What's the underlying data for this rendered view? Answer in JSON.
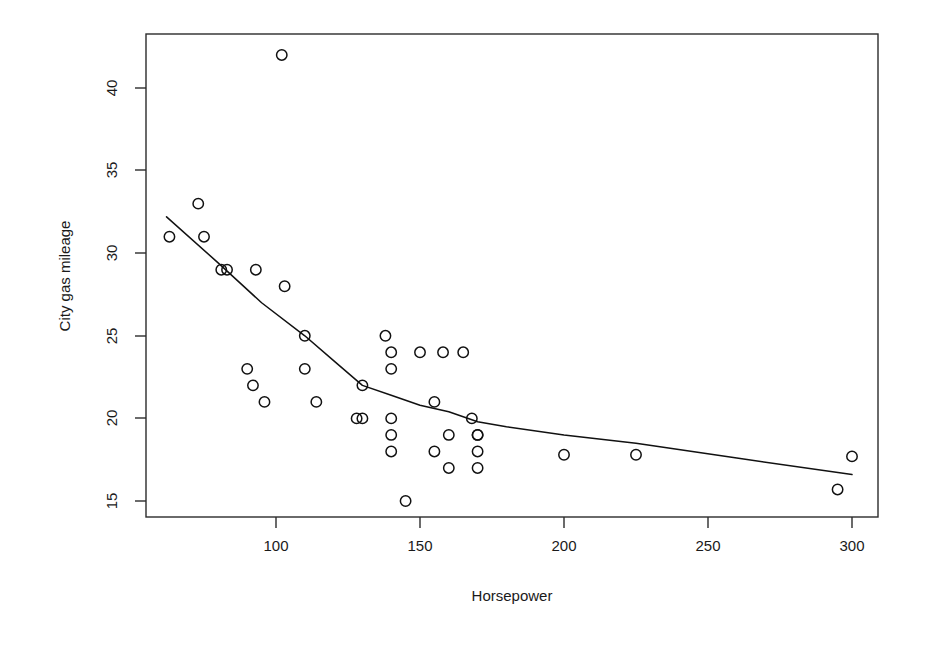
{
  "chart_data": {
    "type": "scatter",
    "title": "",
    "xlabel": "Horsepower",
    "ylabel": "City gas mileage",
    "xlim": [
      55,
      310
    ],
    "ylim": [
      14.2,
      43.2
    ],
    "grid": false,
    "legend": null,
    "x_ticks": [
      100,
      150,
      200,
      250,
      300
    ],
    "y_ticks": [
      15,
      20,
      25,
      30,
      35,
      40
    ],
    "x_tick_labels": [
      "100",
      "150",
      "200",
      "250",
      "300"
    ],
    "y_tick_labels": [
      "15",
      "20",
      "25",
      "30",
      "35",
      "40"
    ],
    "marker": "open-circle",
    "points": [
      {
        "x": 63,
        "y": 31
      },
      {
        "x": 73,
        "y": 33
      },
      {
        "x": 75,
        "y": 31
      },
      {
        "x": 81,
        "y": 29
      },
      {
        "x": 83,
        "y": 29
      },
      {
        "x": 90,
        "y": 23
      },
      {
        "x": 92,
        "y": 22
      },
      {
        "x": 93,
        "y": 29
      },
      {
        "x": 96,
        "y": 21
      },
      {
        "x": 102,
        "y": 42
      },
      {
        "x": 103,
        "y": 28
      },
      {
        "x": 110,
        "y": 25
      },
      {
        "x": 110,
        "y": 23
      },
      {
        "x": 114,
        "y": 21
      },
      {
        "x": 128,
        "y": 20
      },
      {
        "x": 130,
        "y": 20
      },
      {
        "x": 130,
        "y": 22
      },
      {
        "x": 138,
        "y": 25
      },
      {
        "x": 140,
        "y": 24
      },
      {
        "x": 140,
        "y": 23
      },
      {
        "x": 140,
        "y": 20
      },
      {
        "x": 140,
        "y": 19
      },
      {
        "x": 140,
        "y": 18
      },
      {
        "x": 145,
        "y": 15
      },
      {
        "x": 150,
        "y": 24
      },
      {
        "x": 155,
        "y": 21
      },
      {
        "x": 155,
        "y": 18
      },
      {
        "x": 158,
        "y": 24
      },
      {
        "x": 160,
        "y": 19
      },
      {
        "x": 160,
        "y": 17
      },
      {
        "x": 165,
        "y": 24
      },
      {
        "x": 168,
        "y": 20
      },
      {
        "x": 170,
        "y": 19
      },
      {
        "x": 170,
        "y": 19
      },
      {
        "x": 170,
        "y": 18
      },
      {
        "x": 170,
        "y": 17
      },
      {
        "x": 200,
        "y": 17.8
      },
      {
        "x": 225,
        "y": 17.8
      },
      {
        "x": 295,
        "y": 15.7
      },
      {
        "x": 300,
        "y": 17.7
      }
    ],
    "smoother": {
      "name": "lowess-fit",
      "points": [
        {
          "x": 62,
          "y": 32.2
        },
        {
          "x": 80,
          "y": 29.4
        },
        {
          "x": 95,
          "y": 27.0
        },
        {
          "x": 110,
          "y": 25.0
        },
        {
          "x": 120,
          "y": 23.5
        },
        {
          "x": 130,
          "y": 22.0
        },
        {
          "x": 140,
          "y": 21.4
        },
        {
          "x": 150,
          "y": 20.8
        },
        {
          "x": 160,
          "y": 20.4
        },
        {
          "x": 170,
          "y": 19.8
        },
        {
          "x": 180,
          "y": 19.5
        },
        {
          "x": 200,
          "y": 19.0
        },
        {
          "x": 225,
          "y": 18.5
        },
        {
          "x": 260,
          "y": 17.6
        },
        {
          "x": 300,
          "y": 16.6
        }
      ]
    }
  },
  "axes": {
    "x_axis_label": "Horsepower",
    "y_axis_label": "City gas mileage"
  }
}
